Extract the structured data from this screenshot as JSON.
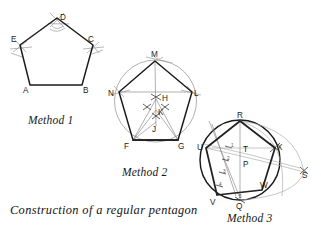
{
  "figure": {
    "caption": "Construction of a regular pentagon",
    "background_color": "#ffffff",
    "ink_color": "#1a1a1a",
    "construction_line_color": "#9a9a9a",
    "width": 321,
    "height": 228
  },
  "methods": [
    {
      "id": "method-1",
      "label": "Method 1",
      "label_pos": {
        "x": 28,
        "y": 120
      },
      "description": "Regular pentagon with compass arcs at vertices C, D and E",
      "vertices": [
        {
          "name": "A",
          "x": 30,
          "y": 85,
          "label_x": 23,
          "label_y": 92
        },
        {
          "name": "B",
          "x": 82,
          "y": 85,
          "label_x": 84,
          "label_y": 92
        },
        {
          "name": "C",
          "x": 93,
          "y": 45,
          "label_x": 89,
          "label_y": 41
        },
        {
          "name": "D",
          "x": 57,
          "y": 18,
          "label_x": 59,
          "label_y": 18
        },
        {
          "name": "E",
          "x": 20,
          "y": 45,
          "label_x": 12,
          "label_y": 41
        }
      ],
      "arc_marks": [
        {
          "at": "D",
          "cx": 57,
          "cy": 18
        },
        {
          "at": "C",
          "cx": 93,
          "cy": 45
        },
        {
          "at": "E",
          "cx": 20,
          "cy": 45
        }
      ]
    },
    {
      "id": "method-2",
      "label": "Method 2",
      "label_pos": {
        "x": 122,
        "y": 172
      },
      "description": "Regular pentagon inscribed in a circle, constructed from bisection points H, K, J",
      "circle": {
        "cx": 155.5,
        "cy": 101,
        "r": 41
      },
      "vertices": [
        {
          "name": "M",
          "x": 155,
          "y": 61,
          "label_x": 152,
          "label_y": 56
        },
        {
          "name": "N",
          "x": 119,
          "y": 92,
          "label_x": 110,
          "label_y": 93
        },
        {
          "name": "L",
          "x": 192,
          "y": 92,
          "label_x": 194,
          "label_y": 93
        },
        {
          "name": "F",
          "x": 133,
          "y": 140,
          "label_x": 125,
          "label_y": 147
        },
        {
          "name": "G",
          "x": 178,
          "y": 140,
          "label_x": 179,
          "label_y": 147
        }
      ],
      "construction_points": [
        {
          "name": "H",
          "x": 156,
          "y": 99,
          "label_x": 162,
          "label_y": 98
        },
        {
          "name": "K",
          "x": 156,
          "y": 110,
          "label_x": 159,
          "label_y": 113
        },
        {
          "name": "J",
          "x": 156,
          "y": 122,
          "label_x": 153,
          "label_y": 131
        }
      ]
    },
    {
      "id": "method-3",
      "label": "Method 3",
      "label_pos": {
        "x": 227,
        "y": 218
      },
      "description": "Regular pentagon from a circle divided into five equal parts, with diagonal scale 1-5 and external point S",
      "circle": {
        "cx": 240,
        "cy": 160,
        "r": 40
      },
      "vertices": [
        {
          "name": "R",
          "x": 240,
          "y": 121,
          "label_x": 237,
          "label_y": 117
        },
        {
          "name": "U",
          "x": 206,
          "y": 148,
          "label_x": 198,
          "label_y": 148
        },
        {
          "name": "X",
          "x": 275,
          "y": 148,
          "label_x": 277,
          "label_y": 148
        },
        {
          "name": "V",
          "x": 217,
          "y": 195,
          "label_x": 211,
          "label_y": 203
        },
        {
          "name": "W",
          "x": 262,
          "y": 190,
          "label_x": 261,
          "label_y": 187
        }
      ],
      "construction_points": [
        {
          "name": "T",
          "x": 244,
          "y": 148,
          "label_x": 243,
          "label_y": 151
        },
        {
          "name": "P",
          "x": 244,
          "y": 163,
          "label_x": 243,
          "label_y": 166
        },
        {
          "name": "Q",
          "x": 240,
          "y": 200,
          "label_x": 236,
          "label_y": 207
        },
        {
          "name": "S",
          "x": 304,
          "y": 172,
          "label_x": 303,
          "label_y": 176
        }
      ],
      "scale_divisions": [
        {
          "name": "1",
          "x": 232,
          "y": 146
        },
        {
          "name": "2",
          "x": 228,
          "y": 158
        },
        {
          "name": "3",
          "x": 224,
          "y": 171
        },
        {
          "name": "4",
          "x": 220,
          "y": 184
        },
        {
          "name": "5",
          "x": 240,
          "y": 196
        }
      ]
    }
  ]
}
